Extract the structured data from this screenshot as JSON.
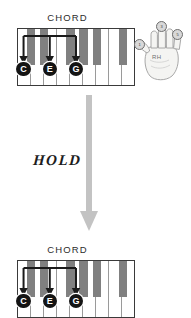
{
  "diagram": {
    "title_top": "CHORD",
    "title_bottom": "CHORD",
    "hold_label": "HOLD",
    "hand_label": "RH",
    "colors": {
      "black_key": "#808080",
      "white_key": "#ffffff",
      "keyboard_border": "#3a3a3a",
      "note_circle": "#141414",
      "arrow_dark": "#1a1a1a",
      "hold_arrow": "#bfbfbf",
      "finger_circle": "#d8d8d8"
    },
    "top_keyboard": {
      "white_key_count": 9,
      "notes": [
        {
          "name": "C",
          "white_index": 0
        },
        {
          "name": "E",
          "white_index": 2
        },
        {
          "name": "G",
          "white_index": 4
        }
      ],
      "black_key_pattern": [
        1,
        1,
        0,
        1,
        1,
        1,
        0,
        1,
        1
      ]
    },
    "bottom_keyboard": {
      "white_key_count": 9,
      "notes": [
        {
          "name": "C",
          "white_index": 0
        },
        {
          "name": "E",
          "white_index": 2
        },
        {
          "name": "G",
          "white_index": 4
        }
      ],
      "black_key_pattern": [
        1,
        1,
        0,
        1,
        1,
        1,
        0,
        1,
        1
      ]
    },
    "hand": {
      "side": "RH",
      "fingers": [
        {
          "number": "1",
          "name": "thumb"
        },
        {
          "number": "3",
          "name": "middle"
        },
        {
          "number": "5",
          "name": "pinky"
        }
      ]
    }
  }
}
